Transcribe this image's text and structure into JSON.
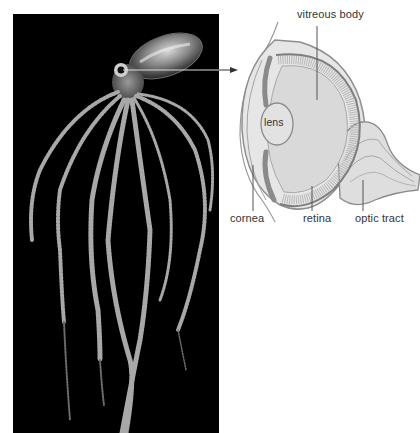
{
  "figure": {
    "photo": {
      "subject": "octopus",
      "background_color": "#000000"
    },
    "diagram": {
      "subject": "cephalopod eye cross-section",
      "labels": {
        "vitreous_body": "vitreous body",
        "lens": "lens",
        "cornea": "cornea",
        "retina": "retina",
        "optic_tract": "optic tract"
      }
    },
    "colors": {
      "background": "#ffffff",
      "photo_bg": "#000000",
      "diagram_fill": "#e4e4e4",
      "diagram_stroke": "#8a8a8a",
      "label_text": "#333333",
      "leader_line": "#555555"
    }
  }
}
